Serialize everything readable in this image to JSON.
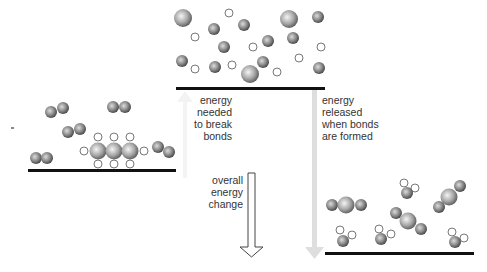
{
  "labels": {
    "break_bonds": [
      "energy",
      "needed",
      "to break",
      "bonds"
    ],
    "form_bonds": [
      "energy",
      "released",
      "when bonds",
      "are formed"
    ],
    "overall": [
      "overall",
      "energy",
      "change"
    ]
  },
  "colors": {
    "baseline": "#111111",
    "atom_dark": "#5a5a5a",
    "atom_light": "#e8e8e8",
    "hydrogen_stroke": "#555555",
    "release_arrow": "#dedede",
    "overall_arrow_stroke": "#444444",
    "text": "#333333"
  },
  "levels": {
    "reactants": "propane + oxygen molecules",
    "separated_atoms": "individual atoms",
    "products": "carbon dioxide + water molecules"
  }
}
